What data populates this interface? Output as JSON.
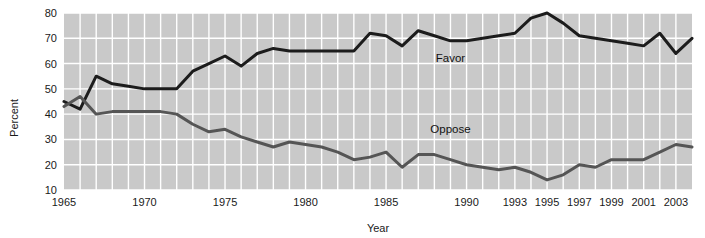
{
  "chart_data": {
    "type": "line",
    "title": "",
    "subtitle": "",
    "xlabel": "Year",
    "ylabel": "Percent",
    "xlim": [
      1965,
      2004
    ],
    "ylim": [
      10,
      80
    ],
    "grid": true,
    "legend_position": "inline-annotation",
    "y_ticks": [
      10,
      20,
      30,
      40,
      50,
      60,
      70,
      80
    ],
    "y_tick_labels": [
      "10",
      "20",
      "30",
      "40",
      "50",
      "60",
      "70",
      "80"
    ],
    "x_ticks": [
      1965,
      1970,
      1975,
      1980,
      1985,
      1990,
      1993,
      1995,
      1997,
      1999,
      2001,
      2003
    ],
    "x_tick_labels": [
      "1965",
      "1970",
      "1975",
      "1980",
      "1985",
      "1990",
      "1993",
      "1995",
      "1997",
      "1999",
      "2001",
      "2003"
    ],
    "annotations": [
      {
        "text": "Favor",
        "x": 1989,
        "y": 60.5
      },
      {
        "text": "Oppose",
        "x": 1989,
        "y": 32.5
      }
    ],
    "x": [
      1965,
      1966,
      1967,
      1968,
      1969,
      1970,
      1971,
      1972,
      1973,
      1974,
      1975,
      1976,
      1977,
      1978,
      1979,
      1980,
      1981,
      1982,
      1983,
      1984,
      1985,
      1986,
      1987,
      1988,
      1989,
      1990,
      1991,
      1992,
      1993,
      1994,
      1995,
      1996,
      1997,
      1998,
      1999,
      2000,
      2001,
      2002,
      2003,
      2004
    ],
    "series": [
      {
        "name": "Favor",
        "color": "#1c1c1c",
        "values": [
          45,
          42,
          55,
          52,
          51,
          50,
          50,
          50,
          57,
          60,
          63,
          59,
          64,
          66,
          65,
          65,
          65,
          65,
          65,
          72,
          71,
          67,
          73,
          71,
          69,
          69,
          70,
          71,
          72,
          78,
          80,
          76,
          71,
          70,
          69,
          68,
          67,
          72,
          64,
          70
        ]
      },
      {
        "name": "Oppose",
        "color": "#555555",
        "values": [
          43,
          47,
          40,
          41,
          41,
          41,
          41,
          40,
          36,
          33,
          34,
          31,
          29,
          27,
          29,
          28,
          27,
          25,
          22,
          23,
          25,
          19,
          24,
          24,
          22,
          20,
          19,
          18,
          19,
          17,
          14,
          16,
          20,
          19,
          22,
          22,
          22,
          25,
          28,
          27
        ]
      }
    ]
  }
}
